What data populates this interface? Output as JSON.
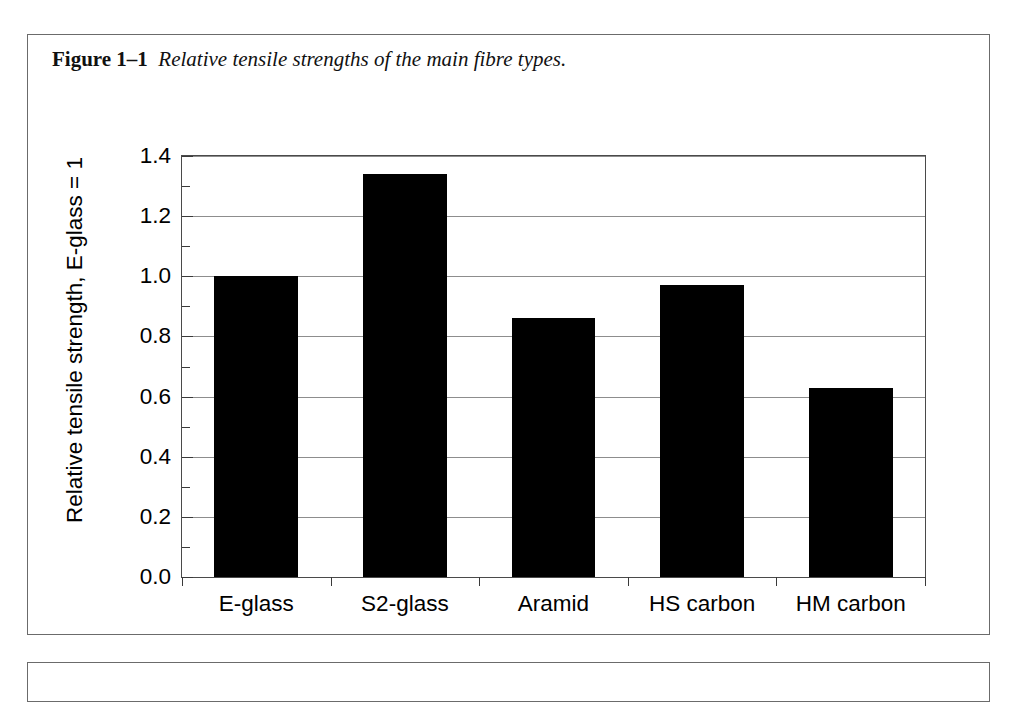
{
  "figure": {
    "number": "Figure 1–1",
    "caption": "Relative tensile strengths of the main fibre types."
  },
  "chart_data": {
    "type": "bar",
    "title": "Relative tensile strengths of the main fibre types.",
    "categories": [
      "E-glass",
      "S2-glass",
      "Aramid",
      "HS carbon",
      "HM carbon"
    ],
    "values": [
      1.0,
      1.34,
      0.86,
      0.97,
      0.63
    ],
    "xlabel": "",
    "ylabel": "Relative tensile strength, E-glass = 1",
    "ylim": [
      0.0,
      1.4
    ],
    "ytick_labels": [
      "0.0",
      "0.2",
      "0.4",
      "0.6",
      "0.8",
      "1.0",
      "1.2",
      "1.4"
    ],
    "ytick_values": [
      0.0,
      0.2,
      0.4,
      0.6,
      0.8,
      1.0,
      1.2,
      1.4
    ],
    "yminor_values": [
      0.1,
      0.3,
      0.5,
      0.7,
      0.9,
      1.1,
      1.3
    ],
    "grid": true,
    "legend": null,
    "bar_color": "#000000",
    "grid_color": "#8d8d8d",
    "axis_color": "#4a4a4a"
  }
}
